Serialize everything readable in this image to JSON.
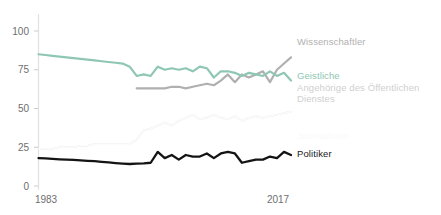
{
  "chart_data": {
    "type": "line",
    "title": "",
    "subtitle": "",
    "xlabel": "",
    "ylabel": "",
    "xlim": [
      1983,
      2019
    ],
    "ylim": [
      0,
      100
    ],
    "yticks": [
      0,
      25,
      50,
      75,
      100
    ],
    "ytick_labels": [
      "0",
      "25",
      "50",
      "75",
      "100"
    ],
    "xticks": [
      1983,
      2017
    ],
    "xtick_labels": [
      "1983",
      "2017"
    ],
    "grid": false,
    "legend_position": "right-inline",
    "x": [
      1983,
      1984,
      1985,
      1986,
      1987,
      1988,
      1989,
      1990,
      1991,
      1992,
      1993,
      1994,
      1995,
      1996,
      1997,
      1998,
      1999,
      2000,
      2001,
      2002,
      2003,
      2004,
      2005,
      2006,
      2007,
      2008,
      2009,
      2010,
      2011,
      2012,
      2013,
      2014,
      2015,
      2016,
      2017,
      2018,
      2019
    ],
    "series": [
      {
        "name": "Wissenschaftler",
        "color": "#b0b0b0",
        "width": 2.2,
        "start_index": 14,
        "values": [
          null,
          null,
          null,
          null,
          null,
          null,
          null,
          null,
          null,
          null,
          null,
          null,
          null,
          null,
          63,
          63,
          63,
          63,
          63,
          64,
          64,
          63,
          64,
          65,
          66,
          65,
          68,
          72,
          67,
          72,
          70,
          72,
          74,
          67,
          75,
          79,
          83
        ]
      },
      {
        "name": "Geistliche",
        "color": "#8ec7b2",
        "width": 2.2,
        "start_index": 0,
        "values": [
          85,
          84.5,
          84,
          83.5,
          83,
          82.5,
          82,
          81.5,
          81,
          80.5,
          80,
          79.5,
          79,
          77,
          71,
          72,
          71,
          77,
          75,
          76,
          75,
          76,
          74,
          77,
          76,
          70,
          74,
          74,
          73,
          71,
          73,
          72,
          71,
          74,
          71,
          73,
          68
        ]
      },
      {
        "name": "Angehörige des Öffentlichen\nDienstes",
        "color": "#dcdcdc",
        "width": 1.6,
        "start_index": 0,
        "values": [
          24,
          24,
          24,
          25,
          25,
          25,
          26,
          26,
          27,
          27,
          27,
          27,
          27,
          27,
          30,
          36,
          37,
          39,
          41,
          39,
          42,
          44,
          46,
          43,
          44,
          46,
          44,
          43,
          45,
          42,
          44,
          45,
          44,
          45,
          46,
          47,
          48
        ]
      },
      {
        "name": "Journalisten",
        "color": "#fbfbfb",
        "width": 1.6,
        "start_index": 0,
        "values": [
          24,
          24,
          24,
          25,
          25,
          25,
          26,
          26,
          27,
          27,
          27,
          27,
          27,
          27,
          30,
          36,
          37,
          39,
          41,
          39,
          42,
          44,
          46,
          43,
          44,
          46,
          44,
          43,
          45,
          42,
          44,
          45,
          44,
          45,
          46,
          47,
          48
        ]
      },
      {
        "name": "Politiker",
        "color": "#141414",
        "width": 2.3,
        "start_index": 0,
        "values": [
          18,
          17.8,
          17.5,
          17.2,
          17,
          16.8,
          16.5,
          16.2,
          16,
          15.6,
          15.2,
          14.8,
          14.5,
          14.2,
          14.4,
          14.6,
          15,
          22,
          18,
          20,
          17,
          20,
          19,
          19,
          21,
          18,
          21,
          22,
          21,
          15,
          16,
          17,
          17,
          19,
          18,
          22,
          20
        ]
      }
    ]
  },
  "legend": {
    "items": [
      {
        "label": "Wissenschaftler",
        "color": "#b0b0b0",
        "top": 36,
        "left": 297
      },
      {
        "label": "Geistliche",
        "color": "#8ec7b2",
        "top": 70,
        "left": 297
      },
      {
        "label": "Angehörige des Öffentlichen\nDienstes",
        "color": "#cfcfcf",
        "top": 82,
        "left": 297
      },
      {
        "label": "Journalisten",
        "color": "#fafafa",
        "top": 130,
        "left": 297
      },
      {
        "label": "Politiker",
        "color": "#1a1a1a",
        "top": 148,
        "left": 297
      }
    ]
  },
  "axes": {
    "y_labels": [
      "100",
      "75",
      "50",
      "25",
      "0"
    ],
    "x_labels": [
      "1983",
      "2017"
    ]
  }
}
